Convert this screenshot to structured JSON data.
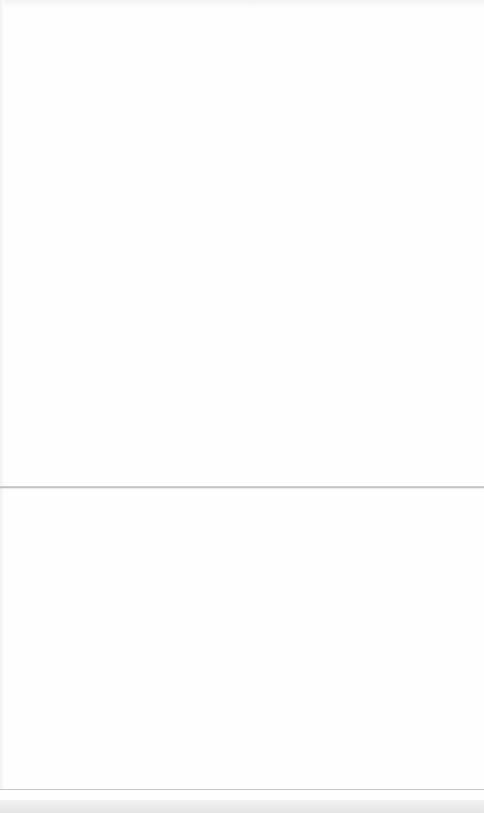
{
  "document": {
    "type": "blank-folded-sheet",
    "panels": [
      {
        "name": "upper-panel",
        "text": ""
      },
      {
        "name": "lower-panel",
        "text": ""
      }
    ]
  },
  "colors": {
    "background": "#fefefe",
    "fold_line": "#c4c4c4",
    "bottom_strip": "#e9e9e9"
  }
}
